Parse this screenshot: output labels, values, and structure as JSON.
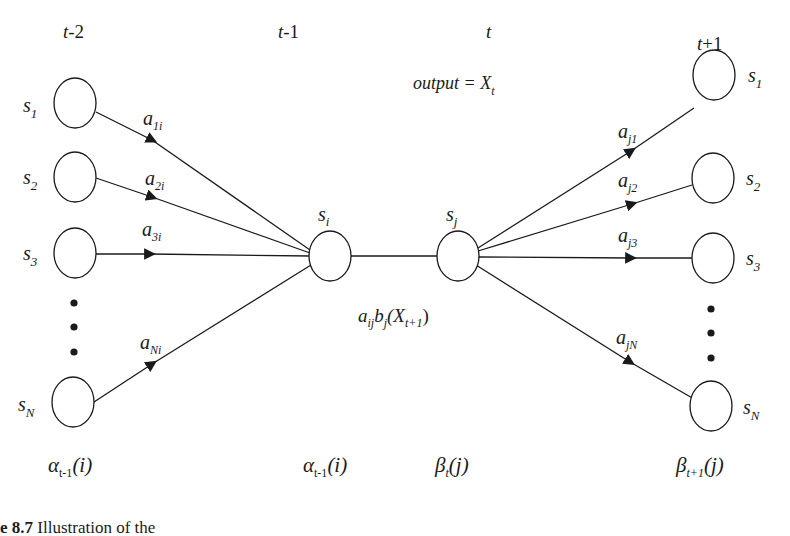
{
  "time_labels": {
    "t_minus_2": "t-2",
    "t_minus_1": "t-1",
    "t": "t",
    "t_plus_1": "t+1"
  },
  "output_label": {
    "text": "output = X",
    "sub": "t"
  },
  "left_states": [
    {
      "name": "s",
      "sub": "1",
      "edge_base": "a",
      "edge_sub": "1i"
    },
    {
      "name": "s",
      "sub": "2",
      "edge_base": "a",
      "edge_sub": "2i"
    },
    {
      "name": "s",
      "sub": "3",
      "edge_base": "a",
      "edge_sub": "3i"
    },
    {
      "name": "s",
      "sub": "N",
      "edge_base": "a",
      "edge_sub": "Ni"
    }
  ],
  "right_states": [
    {
      "name": "s",
      "sub": "1",
      "edge_base": "a",
      "edge_sub": "j1"
    },
    {
      "name": "s",
      "sub": "2",
      "edge_base": "a",
      "edge_sub": "j2"
    },
    {
      "name": "s",
      "sub": "3",
      "edge_base": "a",
      "edge_sub": "j3"
    },
    {
      "name": "s",
      "sub": "N",
      "edge_base": "a",
      "edge_sub": "jN"
    }
  ],
  "center_states": {
    "i": {
      "name": "s",
      "sub": "i"
    },
    "j": {
      "name": "s",
      "sub": "j"
    }
  },
  "transition_label": {
    "a": "a",
    "a_sub": "ij",
    "b": "b",
    "b_sub": "j",
    "open": "(X",
    "x_sub": "t+1",
    "close": ")"
  },
  "bottom_labels": {
    "alpha_left": {
      "sym": "α",
      "sub": "t-1",
      "arg": "(i)"
    },
    "alpha_center": {
      "sym": "α",
      "sub": "t-1",
      "arg": "(i)"
    },
    "beta_center": {
      "sym": "β",
      "sub": "t",
      "arg": "(j)"
    },
    "beta_right": {
      "sym": "β",
      "sub": "t+1",
      "arg": "(j)"
    }
  },
  "caption": {
    "number": "e 8.7",
    "text": " Illustration of the"
  },
  "colors": {
    "stroke": "#1a1a1a",
    "background": "#ffffff"
  }
}
